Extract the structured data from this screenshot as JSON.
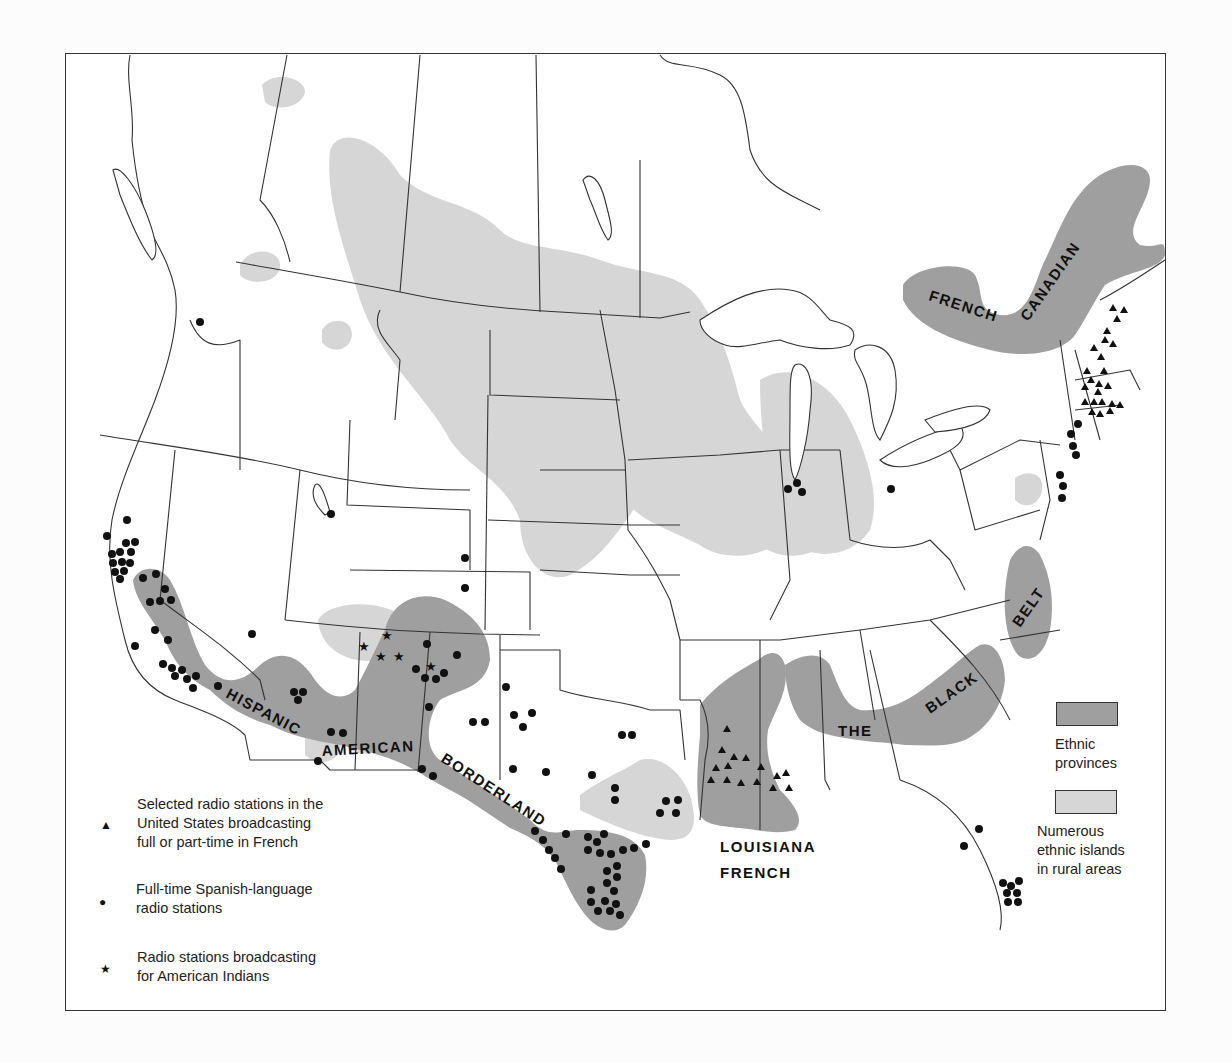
{
  "map": {
    "title": "",
    "region_labels": {
      "french_canadian_1": "FRENCH",
      "french_canadian_2": "CANADIAN",
      "hispanic": "HISPANIC",
      "american": "AMERICAN",
      "borderland": "BORDERLAND",
      "louisiana": "LOUISIANA",
      "french": "FRENCH",
      "the": "THE",
      "black": "BLACK",
      "belt": "BELT"
    },
    "colors": {
      "ethnic_province": "#9f9f9f",
      "ethnic_island": "#d6d6d6",
      "border": "#333333",
      "symbol": "#111111"
    }
  },
  "legend_symbols": {
    "french": {
      "icon": "triangle-icon",
      "glyph": "▲",
      "lines": [
        "Selected radio stations in the",
        "United States broadcasting",
        "full or part-time in French"
      ]
    },
    "spanish": {
      "icon": "circle-icon",
      "glyph": "●",
      "lines": [
        "Full-time Spanish-language",
        "radio stations"
      ]
    },
    "indian": {
      "icon": "star-icon",
      "glyph": "★",
      "lines": [
        "Radio stations broadcasting",
        "for American Indians"
      ]
    }
  },
  "legend_areas": {
    "provinces": {
      "lines": [
        "Ethnic",
        "provinces"
      ],
      "color": "#9f9f9f"
    },
    "islands": {
      "lines": [
        "Numerous",
        "ethnic islands",
        "in rural areas"
      ],
      "color": "#d6d6d6"
    }
  }
}
